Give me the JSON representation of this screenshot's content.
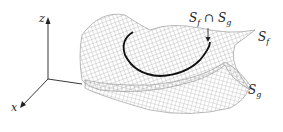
{
  "figure": {
    "axes": {
      "z_label": "z",
      "x_label": "x"
    },
    "labels": {
      "intersection": {
        "S": "S",
        "f": "f",
        "cap": "∩",
        "S2": "S",
        "g": "g"
      },
      "surface_f": {
        "S": "S",
        "sub": "f"
      },
      "surface_g": {
        "S": "S",
        "sub": "g"
      }
    },
    "colors": {
      "mesh": "#9a9a9a",
      "curve": "#111111",
      "axes": "#222222",
      "background": "#ffffff"
    }
  }
}
